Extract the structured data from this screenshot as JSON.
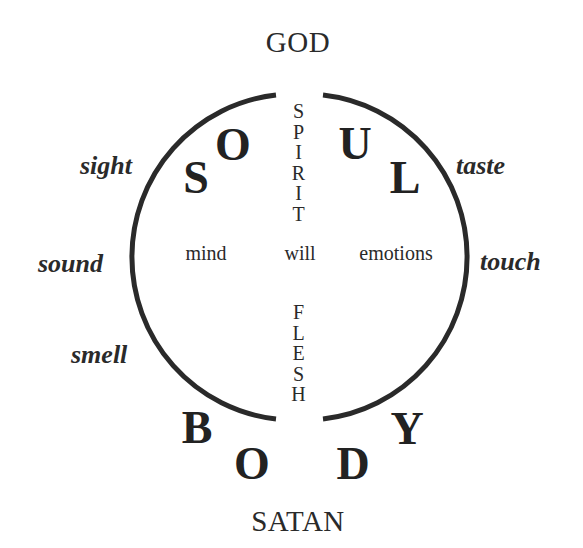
{
  "poles": {
    "top": "GOD",
    "bottom": "SATAN"
  },
  "soul_letters": [
    "S",
    "O",
    "U",
    "L"
  ],
  "body_letters": [
    "B",
    "O",
    "D",
    "Y"
  ],
  "vertical_words": {
    "upper": [
      "S",
      "P",
      "I",
      "R",
      "I",
      "T"
    ],
    "lower": [
      "F",
      "L",
      "E",
      "S",
      "H"
    ]
  },
  "faculties": {
    "left": "mind",
    "center": "will",
    "right": "emotions"
  },
  "senses": {
    "left": [
      "sight",
      "sound",
      "smell"
    ],
    "right": [
      "taste",
      "touch"
    ]
  },
  "colors": {
    "ink": "#2a2a2a",
    "background": "#ffffff"
  }
}
